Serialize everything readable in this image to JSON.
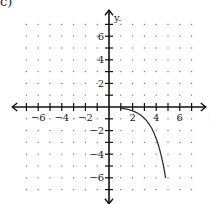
{
  "problem_label": "c)",
  "chart_data": {
    "type": "line",
    "title": "",
    "xlabel": "x",
    "ylabel": "y",
    "xlim": [
      -8,
      8
    ],
    "ylim": [
      -8,
      8
    ],
    "grid": "dotted",
    "x_tick_labels": [
      "-6",
      "-4",
      "-2",
      "2",
      "4",
      "6"
    ],
    "x_tick_values": [
      -6,
      -4,
      -2,
      2,
      4,
      6
    ],
    "y_tick_labels": [
      "6",
      "4",
      "2",
      "-2",
      "-4",
      "-6"
    ],
    "y_tick_values": [
      6,
      4,
      2,
      -2,
      -4,
      -6
    ],
    "series": [
      {
        "name": "curve",
        "x": [
          1,
          2,
          3,
          3.5,
          4,
          4.4,
          4.8
        ],
        "y": [
          -0.1,
          -0.4,
          -1,
          -1.7,
          -2.8,
          -4.4,
          -7.3
        ]
      }
    ]
  }
}
